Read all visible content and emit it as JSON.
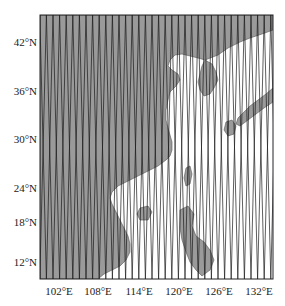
{
  "map": {
    "type": "satellite-ground-track-map",
    "region": "East Asia",
    "land_color": "#9a9a9a",
    "sea_color": "#ffffff",
    "track_color": "#1a1a1a",
    "frame": {
      "left": 40,
      "top": 15,
      "right": 273,
      "bottom": 279
    },
    "y_axis": {
      "labels": [
        {
          "text": "42°N",
          "y": 42
        },
        {
          "text": "36°N",
          "y": 91
        },
        {
          "text": "30°N",
          "y": 139
        },
        {
          "text": "24°N",
          "y": 188
        },
        {
          "text": "18°N",
          "y": 222
        },
        {
          "text": "12°N",
          "y": 262
        }
      ]
    },
    "x_axis": {
      "labels": [
        {
          "text": "102°E",
          "x": 59
        },
        {
          "text": "108°E",
          "x": 98
        },
        {
          "text": "114°E",
          "x": 139
        },
        {
          "text": "120°E",
          "x": 179
        },
        {
          "text": "126°E",
          "x": 219
        },
        {
          "text": "132°E",
          "x": 259
        }
      ]
    },
    "tracks": {
      "pattern": "crossing ascending/descending ground tracks",
      "spacing_px": 6.6,
      "half_period_px": 34
    }
  }
}
